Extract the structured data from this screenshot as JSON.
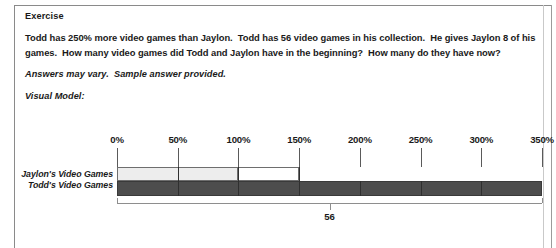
{
  "document": {
    "exercise_title": "Exercise",
    "problem_text": "Todd has 250% more video games than Jaylon.  Todd has 56 video games in his collection.  He gives Jaylon 8 of his games.  How many video games did Todd and Jaylon have in the beginning?  How many do they have now?",
    "note_text": "Answers may vary.  Sample answer provided.",
    "visual_model_label": "Visual Model:"
  },
  "chart_data": {
    "type": "bar",
    "title": "Visual Model:",
    "orientation": "horizontal",
    "xlabel": "",
    "ylabel": "",
    "xlim": [
      0,
      350
    ],
    "grid": false,
    "legend": "none",
    "tick_labels": [
      "0%",
      "50%",
      "100%",
      "150%",
      "200%",
      "250%",
      "300%",
      "350%"
    ],
    "tick_values": [
      0,
      50,
      100,
      150,
      200,
      250,
      300,
      350
    ],
    "categories": [
      "Jaylon's Video Games",
      "Todd's Video Games"
    ],
    "series": [
      {
        "name": "Jaylon's Video Games",
        "start": 0,
        "filled_to": 100,
        "outlined_to": 150,
        "fill_color": "#ededed",
        "stroke_color": "#6e6e6e",
        "internal_divisions": [
          50,
          100
        ]
      },
      {
        "name": "Todd's Video Games",
        "start": 0,
        "filled_to": 350,
        "fill_color": "#4d4d4d",
        "stroke_color": "#3a3a3a",
        "internal_divisions": [
          50,
          100,
          150,
          200,
          250,
          300
        ]
      }
    ],
    "annotations": [
      {
        "type": "brace",
        "label": "56",
        "from": 0,
        "to": 350,
        "at": 175
      }
    ]
  },
  "colors": {
    "page_border": "#8a8a8a",
    "light_bar": "#ededed",
    "dark_bar": "#4d4d4d",
    "tick": "#5a5a5a",
    "text": "#1a1a1a"
  }
}
